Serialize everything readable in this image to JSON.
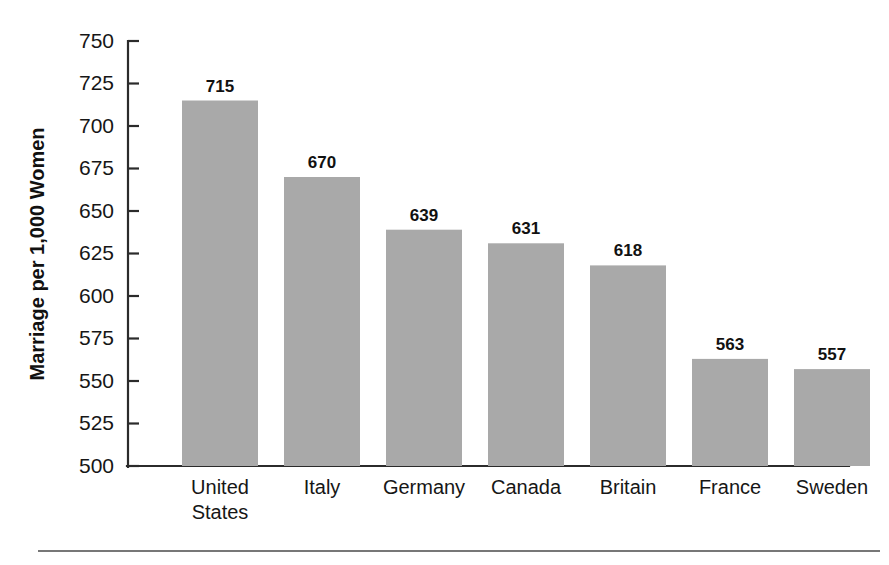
{
  "chart_data": {
    "type": "bar",
    "title": "",
    "subtitle": "",
    "xlabel": "",
    "ylabel": "Marriage per 1,000 Women",
    "categories": [
      "United States",
      "Italy",
      "Germany",
      "Canada",
      "Britain",
      "France",
      "Sweden"
    ],
    "values": [
      715,
      670,
      639,
      631,
      618,
      563,
      557
    ],
    "value_labels": [
      "715",
      "670",
      "639",
      "631",
      "618",
      "563",
      "557"
    ],
    "ylim": [
      500,
      750
    ],
    "ytick_step": 25,
    "ytick_labels": [
      "750",
      "725",
      "700",
      "675",
      "650",
      "625",
      "600",
      "575",
      "550",
      "525",
      "500"
    ],
    "ytick_values": [
      750,
      725,
      700,
      675,
      650,
      625,
      600,
      575,
      550,
      525,
      500
    ],
    "grid": false,
    "legend": null,
    "legend_position": "none",
    "bar_color": "#a9a9a9",
    "axis_color": "#2b2b2b",
    "text_color": "#161616",
    "background_color": "#ffffff",
    "annotations": []
  },
  "figure": {
    "footer_rule_color": "#4a4a4a"
  }
}
